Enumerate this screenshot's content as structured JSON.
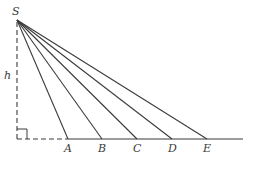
{
  "diagram": {
    "source_label": "S",
    "height_label": "h",
    "points": [
      {
        "label": "A",
        "x": 68
      },
      {
        "label": "B",
        "x": 102
      },
      {
        "label": "C",
        "x": 137
      },
      {
        "label": "D",
        "x": 172
      },
      {
        "label": "E",
        "x": 207
      }
    ],
    "colors": {
      "line": "#3a3a3a",
      "background": "#ffffff"
    }
  }
}
